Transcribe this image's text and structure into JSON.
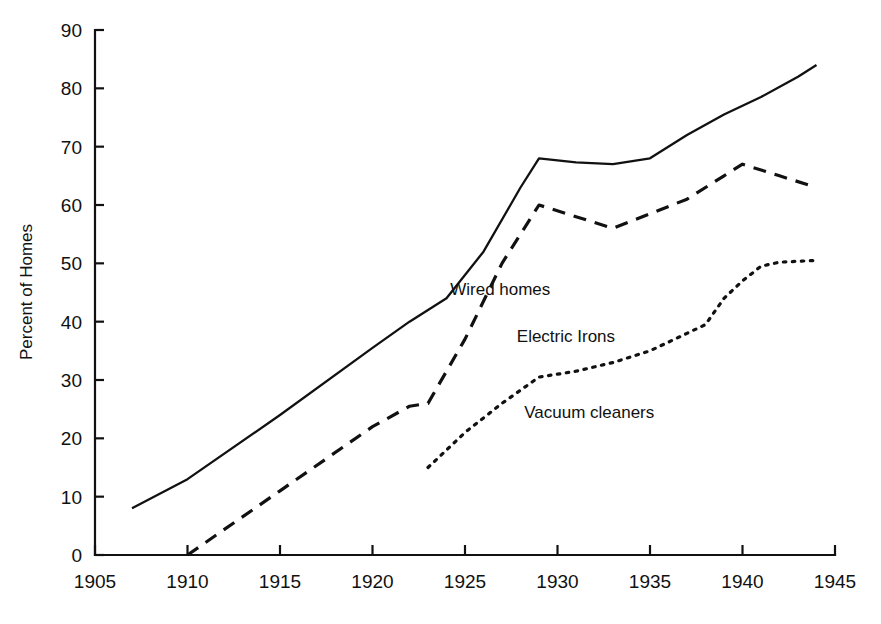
{
  "chart_data": {
    "type": "line",
    "title": "",
    "subtitle": "",
    "xlabel": "",
    "ylabel": "Percent of Homes",
    "xlim": [
      1905,
      1945
    ],
    "ylim": [
      0,
      90
    ],
    "xticks": [
      1905,
      1910,
      1915,
      1920,
      1925,
      1930,
      1935,
      1940,
      1945
    ],
    "yticks": [
      0,
      10,
      20,
      30,
      40,
      50,
      60,
      70,
      80,
      90
    ],
    "xtick_labels": [
      "1905",
      "1910",
      "1915",
      "1920",
      "1925",
      "1930",
      "1935",
      "1940",
      "1945"
    ],
    "ytick_labels": [
      "0",
      "10",
      "20",
      "30",
      "40",
      "50",
      "60",
      "70",
      "80",
      "90"
    ],
    "grid": false,
    "legend": "inline-annotations",
    "series": [
      {
        "name": "Wired homes",
        "style": "solid",
        "color": "#111111",
        "label_x": 1924.2,
        "label_y": 44.5,
        "x": [
          1907,
          1910,
          1915,
          1920,
          1922,
          1924,
          1926,
          1928,
          1929,
          1931,
          1933,
          1935,
          1937,
          1939,
          1941,
          1943,
          1944
        ],
        "y": [
          8,
          13,
          24,
          35.5,
          40,
          44,
          52,
          63,
          68,
          67.3,
          67,
          68,
          72,
          75.5,
          78.5,
          82,
          84
        ]
      },
      {
        "name": "Electric Irons",
        "style": "dashed",
        "color": "#111111",
        "label_x": 1927.8,
        "label_y": 36.5,
        "x": [
          1910,
          1915,
          1920,
          1922,
          1923,
          1925,
          1927,
          1929,
          1931,
          1933,
          1935,
          1937,
          1939,
          1940,
          1942,
          1944
        ],
        "y": [
          0,
          11,
          22,
          25.5,
          26,
          37,
          50,
          60,
          58,
          56,
          58.5,
          61,
          65,
          67,
          65,
          63
        ]
      },
      {
        "name": "Vacuum cleaners",
        "style": "dotted",
        "color": "#111111",
        "label_x": 1928.2,
        "label_y": 23.5,
        "x": [
          1923,
          1925,
          1927,
          1929,
          1931,
          1933,
          1935,
          1936,
          1937,
          1938,
          1939,
          1940,
          1941,
          1942,
          1944
        ],
        "y": [
          15,
          21,
          26,
          30.5,
          31.5,
          33,
          35,
          36.5,
          38,
          39.5,
          44,
          47,
          49.5,
          50.2,
          50.5
        ]
      }
    ]
  },
  "axis": {
    "y_title": "Percent of Homes"
  }
}
